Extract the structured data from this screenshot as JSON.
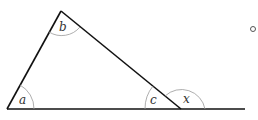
{
  "diagram": {
    "type": "triangle-exterior-angle",
    "labels": {
      "a": "a",
      "b": "b",
      "c": "c",
      "x": "x"
    },
    "marker": "o",
    "colors": {
      "line": "#111111",
      "arc": "#999999",
      "text": "#333333"
    }
  }
}
